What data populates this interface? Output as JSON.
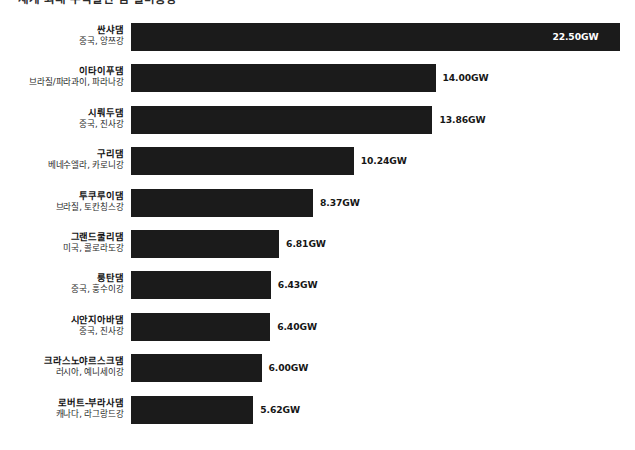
{
  "chart": {
    "title": "세계 최대 수력발전 댐 설비용량",
    "unit_suffix": "GW"
  },
  "chart_data": {
    "type": "bar",
    "orientation": "horizontal",
    "title": "세계 최대 수력발전 댐 설비용량",
    "xlabel": "",
    "ylabel": "",
    "xlim": [
      0,
      23.2
    ],
    "grid": false,
    "legend": null,
    "bar_color": "#1b1b1b",
    "value_suffix": "GW",
    "categories": [
      "싼샤댐",
      "이타이푸댐",
      "시뤄두댐",
      "구리댐",
      "투쿠루이댐",
      "그랜드쿨리댐",
      "룽탄댐",
      "시안지아바댐",
      "크라스노야르스크댐",
      "로버트-부라사댐"
    ],
    "values": [
      22.5,
      14.0,
      13.86,
      10.24,
      8.37,
      6.81,
      6.43,
      6.4,
      6.0,
      5.62
    ],
    "value_labels": [
      "22.50GW",
      "14.00GW",
      "13.86GW",
      "10.24GW",
      "8.37GW",
      "6.40GW",
      "6.43GW",
      "6.40GW",
      "6.00GW",
      "5.62GW"
    ],
    "bars": [
      {
        "name": "싼샤댐",
        "location": "중국, 양쯔강",
        "value": 22.5,
        "value_label": "22.50GW",
        "label_position": "inside"
      },
      {
        "name": "이타이푸댐",
        "location": "브라질/파라과이, 파라나강",
        "value": 14.0,
        "value_label": "14.00GW",
        "label_position": "outside"
      },
      {
        "name": "시뤄두댐",
        "location": "중국, 진사강",
        "value": 13.86,
        "value_label": "13.86GW",
        "label_position": "outside"
      },
      {
        "name": "구리댐",
        "location": "베네수엘라, 카로니강",
        "value": 10.24,
        "value_label": "10.24GW",
        "label_position": "outside"
      },
      {
        "name": "투쿠루이댐",
        "location": "브라질, 토칸칭스강",
        "value": 8.37,
        "value_label": "8.37GW",
        "label_position": "outside"
      },
      {
        "name": "그랜드쿨리댐",
        "location": "미국, 콜로라도강",
        "value": 6.81,
        "value_label": "6.81GW",
        "label_position": "outside"
      },
      {
        "name": "룽탄댐",
        "location": "중국, 훙수이강",
        "value": 6.43,
        "value_label": "6.43GW",
        "label_position": "outside"
      },
      {
        "name": "시안지아바댐",
        "location": "중국, 진사강",
        "value": 6.4,
        "value_label": "6.40GW",
        "label_position": "outside"
      },
      {
        "name": "크라스노야르스크댐",
        "location": "러시아, 예니세이강",
        "value": 6.0,
        "value_label": "6.00GW",
        "label_position": "outside"
      },
      {
        "name": "로버트-부라사댐",
        "location": "캐나다, 라그랑드강",
        "value": 5.62,
        "value_label": "5.62GW",
        "label_position": "outside"
      }
    ]
  }
}
